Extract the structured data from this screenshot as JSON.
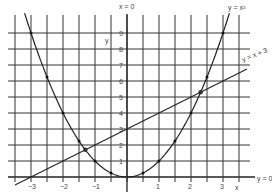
{
  "chart_data": {
    "type": "line",
    "title": "",
    "xlabel": "x",
    "ylabel": "y",
    "xlim": [
      -3.5,
      3.75
    ],
    "ylim": [
      0,
      9.5
    ],
    "grid": true,
    "x_ticks": [
      -3,
      -2,
      -1,
      1,
      2,
      3
    ],
    "x_tick_labels": [
      "−3",
      "−2",
      "−1",
      "1",
      "2",
      "3"
    ],
    "y_ticks": [
      1,
      2,
      3,
      4,
      5,
      6,
      7,
      8,
      9
    ],
    "y_tick_labels": [
      "1",
      "2",
      "3",
      "4",
      "5",
      "6",
      "7",
      "8",
      "9"
    ],
    "series": [
      {
        "name": "y = x²",
        "kind": "curve",
        "points": [
          [
            -3,
            9
          ],
          [
            -2.5,
            6.25
          ],
          [
            -2,
            4
          ],
          [
            -1.5,
            2.25
          ],
          [
            -1,
            1
          ],
          [
            -0.5,
            0.25
          ],
          [
            0,
            0
          ],
          [
            0.5,
            0.25
          ],
          [
            1,
            1
          ],
          [
            1.5,
            2.25
          ],
          [
            2,
            4
          ],
          [
            2.5,
            6.25
          ],
          [
            3,
            9
          ]
        ],
        "marked_points": [
          [
            -3,
            9
          ],
          [
            -2.5,
            6.25
          ],
          [
            -2,
            4
          ],
          [
            -1.5,
            2.25
          ],
          [
            -1,
            1
          ],
          [
            -0.5,
            0.25
          ],
          [
            0.5,
            0.25
          ],
          [
            1,
            1
          ],
          [
            1.5,
            2.25
          ],
          [
            2,
            4
          ],
          [
            2.5,
            6.25
          ],
          [
            3,
            9
          ]
        ]
      },
      {
        "name": "y = x + 3",
        "kind": "line",
        "points": [
          [
            -3.5,
            -0.5
          ],
          [
            3.75,
            6.75
          ]
        ]
      }
    ],
    "intersections": [
      [
        -1.3,
        1.7
      ],
      [
        2.3,
        5.3
      ]
    ],
    "annotations": [
      "x = 0",
      "y = x²",
      "y = x + 3",
      "y = 0"
    ]
  },
  "labels": {
    "x_axis_name": "x",
    "y_axis_name": "y",
    "vertical_axis_eq": "x = 0",
    "horizontal_axis_eq": "y = 0",
    "parabola_eq": "y = x²",
    "line_eq": "y = x + 3"
  }
}
